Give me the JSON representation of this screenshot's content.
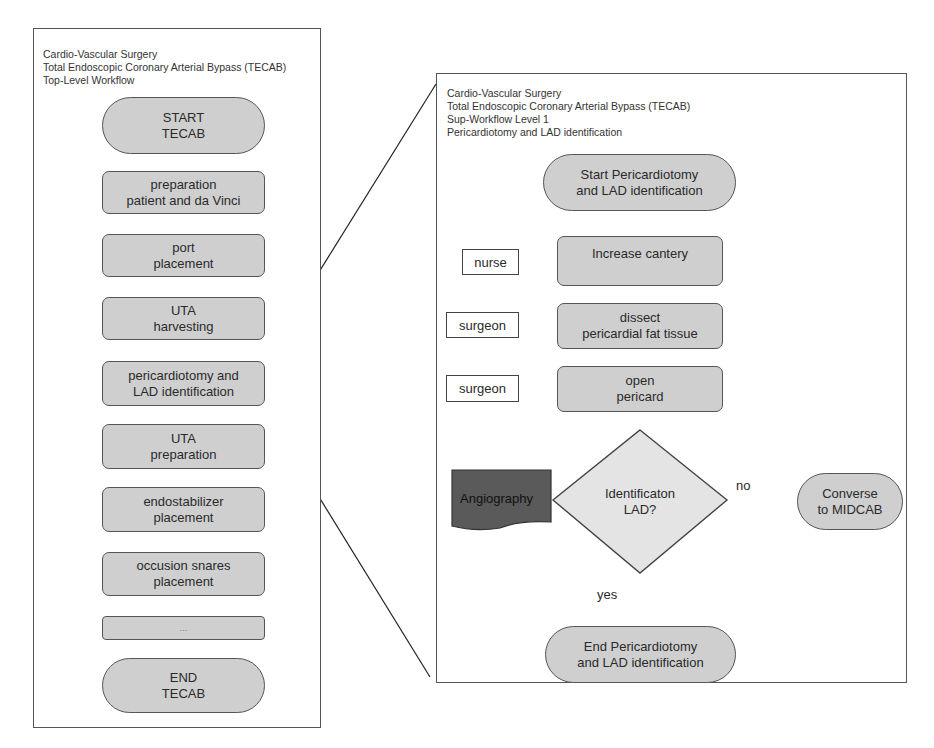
{
  "top_level": {
    "header": [
      "Cardio-Vascular Surgery",
      "Total Endoscopic Coronary Arterial Bypass (TECAB)",
      "Top-Level Workflow"
    ],
    "steps": [
      {
        "id": "start",
        "shape": "terminal",
        "lines": [
          "START",
          "TECAB"
        ]
      },
      {
        "id": "prep",
        "shape": "process",
        "lines": [
          "preparation",
          "patient and da Vinci"
        ]
      },
      {
        "id": "port",
        "shape": "process",
        "lines": [
          "port",
          "placement"
        ]
      },
      {
        "id": "uta-harvest",
        "shape": "process",
        "lines": [
          "UTA",
          "harvesting"
        ]
      },
      {
        "id": "pericardiotomy",
        "shape": "process",
        "lines": [
          "pericardiotomy and",
          "LAD identification"
        ]
      },
      {
        "id": "uta-prep",
        "shape": "process",
        "lines": [
          "UTA",
          "preparation"
        ]
      },
      {
        "id": "endostabilizer",
        "shape": "process",
        "lines": [
          "endostabilizer",
          "placement"
        ]
      },
      {
        "id": "snares",
        "shape": "process",
        "lines": [
          "occusion snares",
          "placement"
        ]
      },
      {
        "id": "ellipsis",
        "shape": "process",
        "lines": [
          "..."
        ]
      },
      {
        "id": "end",
        "shape": "terminal",
        "lines": [
          "END",
          "TECAB"
        ]
      }
    ]
  },
  "sub_workflow": {
    "header": [
      "Cardio-Vascular Surgery",
      "Total Endoscopic Coronary Arterial Bypass (TECAB)",
      "Sup-Workflow Level 1",
      "Pericardiotomy and LAD identification"
    ],
    "start": [
      "Start Pericardiotomy",
      "and LAD identification"
    ],
    "steps": [
      {
        "lines": [
          "Increase cantery"
        ],
        "role": "nurse"
      },
      {
        "lines": [
          "dissect",
          "pericardial fat tissue"
        ],
        "role": "surgeon"
      },
      {
        "lines": [
          "open",
          "pericard"
        ],
        "role": "surgeon"
      }
    ],
    "decision": [
      "Identificaton",
      "LAD?"
    ],
    "input_document": "Angiography",
    "branch_no_label": "no",
    "branch_yes_label": "yes",
    "no_target": [
      "Converse",
      "to MIDCAB"
    ],
    "end": [
      "End Pericardiotomy",
      "and LAD identification"
    ]
  },
  "colors": {
    "node_fill": "#cfcfcf",
    "decision_fill": "#e4e4e4",
    "document_fill": "#5a5a5a",
    "stroke": "#555555"
  }
}
